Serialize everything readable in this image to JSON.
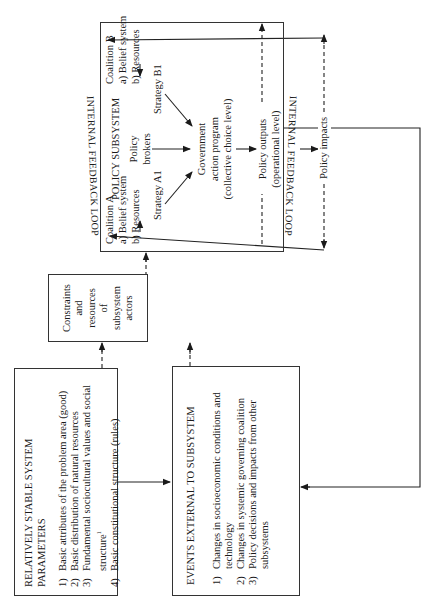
{
  "stable_params": {
    "title_line1": "RELATIVELY STABLE SYSTEM",
    "title_line2": "PARAMETERS",
    "items": [
      {
        "num": "1)",
        "text": "Basic attributes of the problem area (good)"
      },
      {
        "num": "2)",
        "text": "Basic distribution of natural resources"
      },
      {
        "num": "3)",
        "text": "Fundamental sociocultural values and social structure",
        "footnote": "1"
      },
      {
        "num": "4)",
        "text": "Basic constitutional structure (rules)"
      }
    ]
  },
  "external_events": {
    "title": "EVENTS EXTERNAL TO SUBSYSTEM",
    "items": [
      {
        "num": "1)",
        "text": "Changes in socioeconomic conditions and technology"
      },
      {
        "num": "2)",
        "text": "Changes in systemic governing coalition"
      },
      {
        "num": "3)",
        "text": "Policy decisions and impacts from other subsystems"
      }
    ]
  },
  "constraints": {
    "lines": [
      "Constraints",
      "and",
      "resources",
      "of",
      "subsystem",
      "actors"
    ]
  },
  "policy_subsystem": {
    "title": "POLICY SUBSYSTEM",
    "coalition_a": {
      "title": "Coalition A",
      "item_a": "a)  Belief system",
      "item_b": "b)  Resources"
    },
    "coalition_b": {
      "title": "Coalition B",
      "item_a": "a)  Belief system",
      "item_b": "b)  Resources"
    },
    "policy_brokers": [
      "Policy",
      "brokers"
    ],
    "strategy_a": "Strategy A1",
    "strategy_b": "Strategy B1",
    "government_program": [
      "Government",
      "action program",
      "(collective choice level)"
    ],
    "policy_outputs": [
      "Policy outputs",
      "(operational level)"
    ],
    "policy_impacts": "Policy impacts",
    "feedback_top": "INTERNAL FEEDBACK LOOP",
    "feedback_bottom": "INTERNAL FEEDBACK LOOP"
  }
}
